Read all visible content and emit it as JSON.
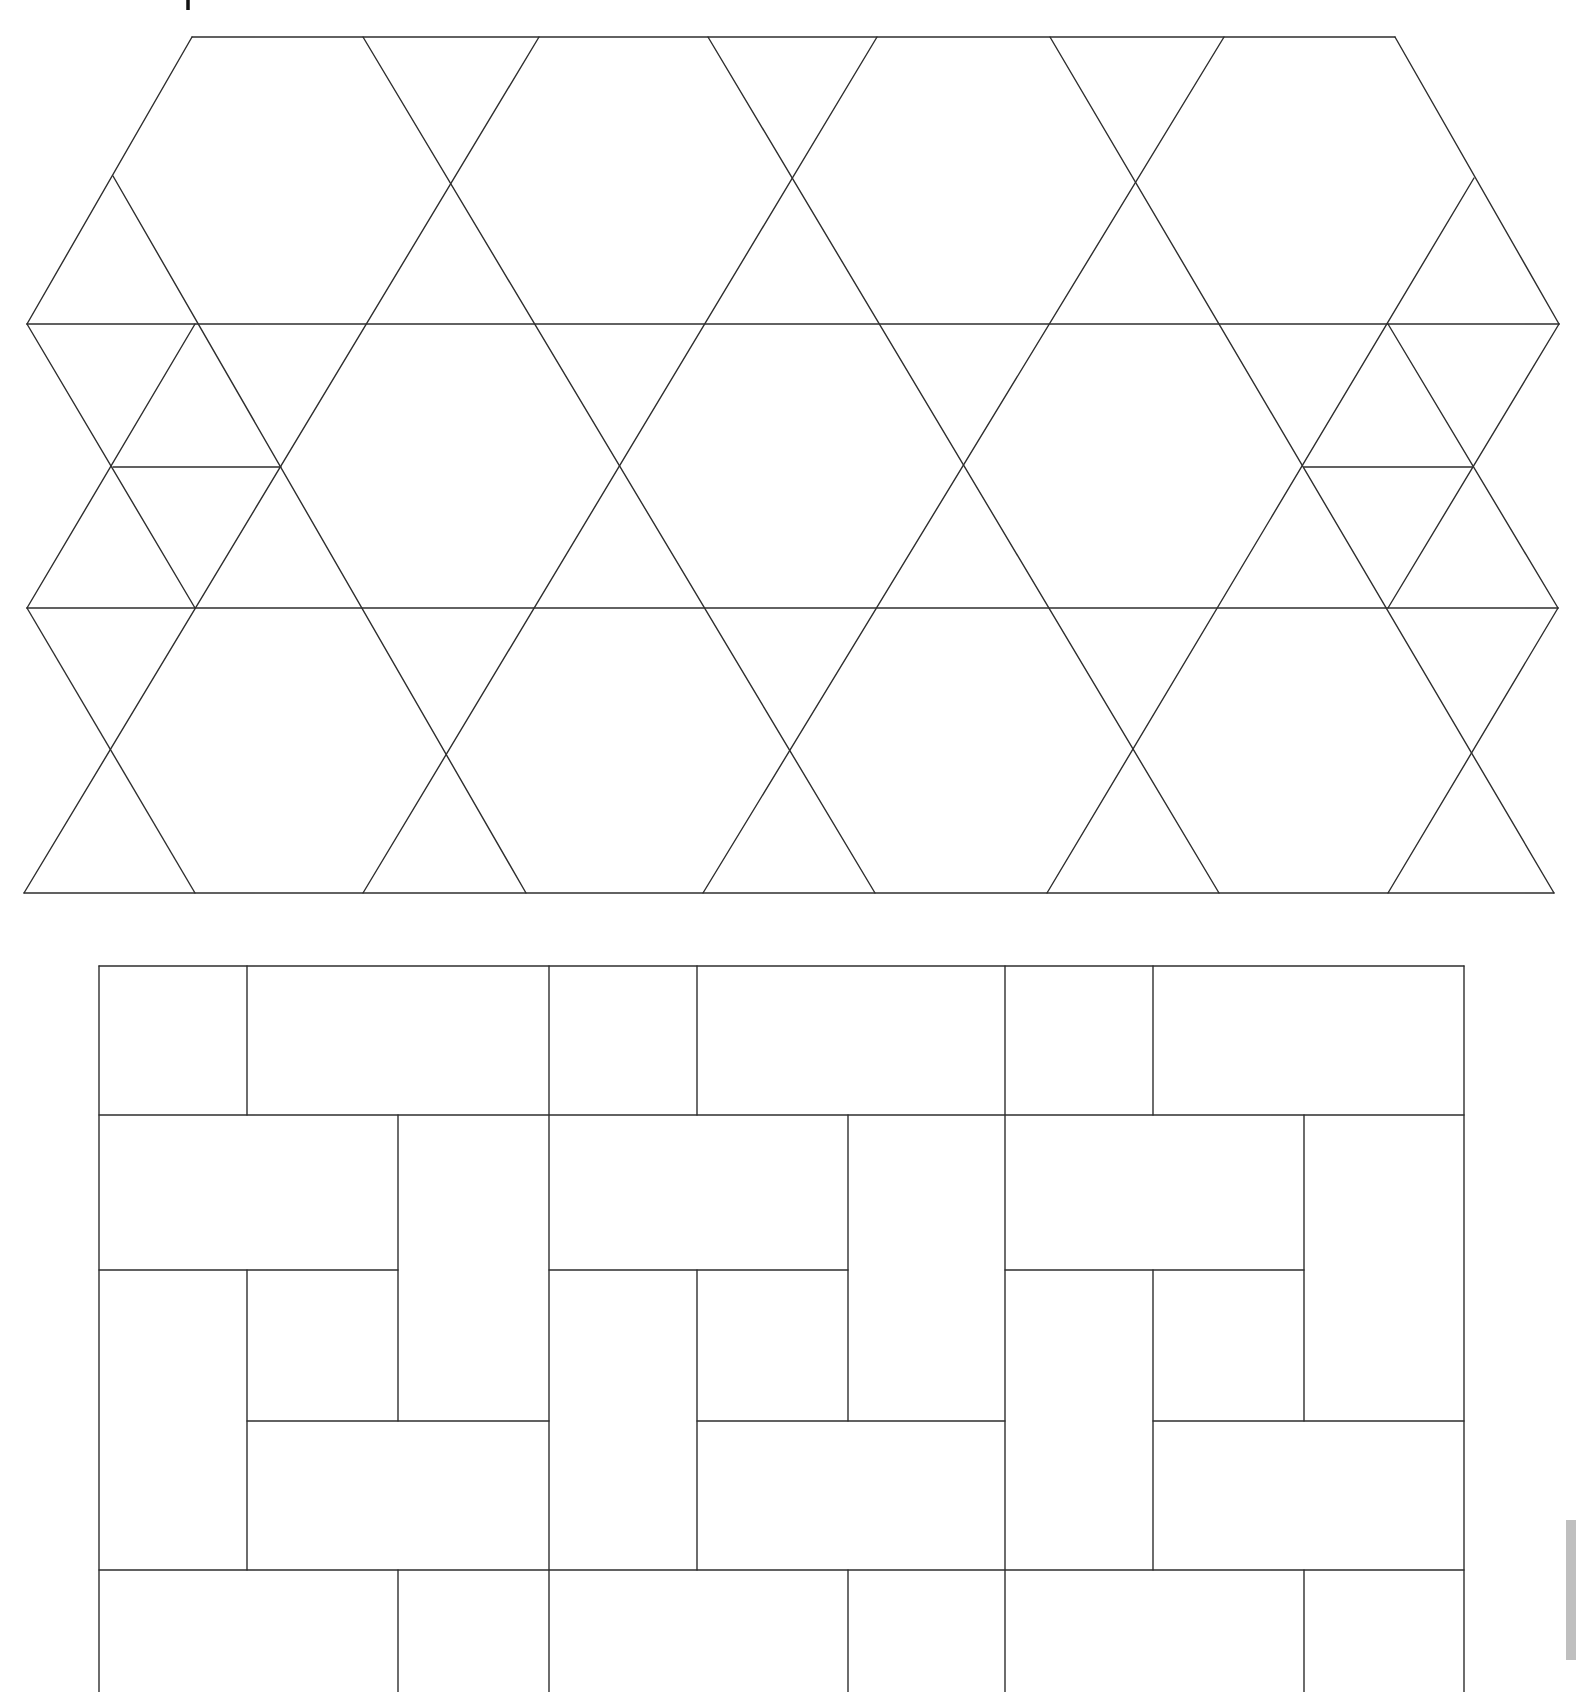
{
  "page": {
    "background": "#ffffff",
    "line_color": "#2e2e2e"
  },
  "figures": [
    {
      "id": "trihexagonal-lattice",
      "label": "Triangle and hexagon lattice pattern",
      "horizontals": [
        [
          192,
          37,
          1395,
          37
        ],
        [
          27,
          324,
          1559,
          324
        ],
        [
          113,
          467,
          281,
          467
        ],
        [
          1304,
          467,
          1472,
          467
        ],
        [
          27,
          608,
          1558,
          608
        ],
        [
          24,
          893,
          1554,
          893
        ]
      ],
      "diagonals": [
        [
          192,
          37,
          27,
          324
        ],
        [
          1395,
          37,
          1559,
          324
        ],
        [
          363,
          37,
          875,
          893
        ],
        [
          539,
          37,
          24,
          893
        ],
        [
          708,
          37,
          1219,
          893
        ],
        [
          877,
          37,
          363,
          893
        ],
        [
          1050,
          37,
          1554,
          893
        ],
        [
          1224,
          37,
          703,
          893
        ],
        [
          1474,
          178,
          1047,
          893
        ],
        [
          113,
          176,
          526,
          893
        ],
        [
          27,
          324,
          195,
          608
        ],
        [
          195,
          324,
          27,
          608
        ],
        [
          1388,
          324,
          1558,
          608
        ],
        [
          1559,
          324,
          1388,
          608
        ],
        [
          27,
          608,
          195,
          893
        ],
        [
          1558,
          608,
          1388,
          893
        ]
      ]
    },
    {
      "id": "pinwheel-rectangles",
      "label": "Interlocking rectangle (pinwheel) pattern",
      "block_origins": [
        99,
        549,
        1005
      ],
      "block_offsets": [
        148,
        299
      ],
      "right_edge": 1464,
      "rows": [
        966,
        1115,
        1270,
        1421,
        1570,
        1692
      ]
    }
  ],
  "marks": {
    "top_tick": {
      "x": 188,
      "y1": 0,
      "y2": 10
    },
    "edge_smudge": {
      "x": 1566,
      "y": 1520,
      "w": 10,
      "h": 140
    }
  }
}
